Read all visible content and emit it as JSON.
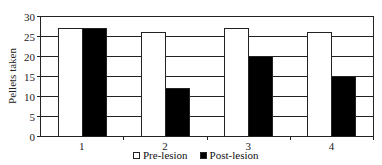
{
  "chart_data": {
    "type": "bar",
    "title": "",
    "xlabel": "",
    "ylabel": "Pellets taken",
    "ylim": [
      0,
      30
    ],
    "yticks": [
      0,
      5,
      10,
      15,
      20,
      25,
      30
    ],
    "grid": true,
    "legend_position": "bottom",
    "categories": [
      "1",
      "2",
      "3",
      "4"
    ],
    "series": [
      {
        "name": "Pre-lesion",
        "color": "#ffffff",
        "values": [
          27,
          26,
          27,
          26
        ]
      },
      {
        "name": "Post-lesion",
        "color": "#000000",
        "values": [
          27,
          12,
          20,
          15
        ]
      }
    ]
  },
  "legend": {
    "items": [
      {
        "label": "Pre-lesion",
        "color": "#ffffff"
      },
      {
        "label": "Post-lesion",
        "color": "#000000"
      }
    ]
  }
}
